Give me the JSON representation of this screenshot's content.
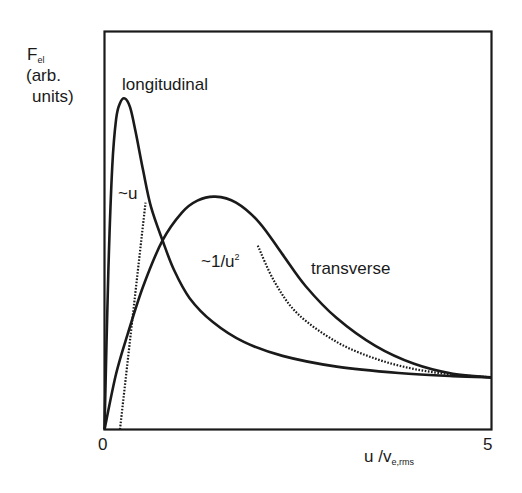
{
  "chart_data": {
    "type": "line",
    "title": "",
    "xlabel": "u / v_e,rms",
    "ylabel": "F_el (arb. units)",
    "xlim": [
      0,
      5
    ],
    "ylim": [
      0,
      100
    ],
    "xticks": [
      "0",
      "5"
    ],
    "grid": false,
    "legend": "none (curves labeled inline)",
    "series": [
      {
        "name": "longitudinal",
        "style": "solid",
        "x": [
          0,
          0.05,
          0.1,
          0.15,
          0.2,
          0.26,
          0.33,
          0.4,
          0.5,
          0.6,
          0.75,
          0.9,
          1.1,
          1.4,
          1.8,
          2.3,
          3.0,
          3.8,
          4.5,
          5.0
        ],
        "y": [
          0,
          40,
          66,
          78,
          82,
          83.2,
          81,
          75,
          65,
          56,
          47.5,
          40,
          33,
          27,
          22,
          18.5,
          15.8,
          14.2,
          13.4,
          13.1
        ]
      },
      {
        "name": "transverse",
        "style": "solid",
        "x": [
          0,
          0.15,
          0.3,
          0.5,
          0.75,
          1.0,
          1.2,
          1.43,
          1.7,
          2.0,
          2.3,
          2.6,
          3.0,
          3.5,
          4.0,
          4.5,
          5.0
        ],
        "y": [
          0,
          14,
          24,
          36,
          47.5,
          54.5,
          57.5,
          58.5,
          57,
          52,
          44,
          36,
          28,
          21,
          16.5,
          14,
          13.1
        ]
      },
      {
        "name": "~u",
        "style": "dotted",
        "x": [
          0.2,
          0.53
        ],
        "y": [
          0,
          57
        ]
      },
      {
        "name": "~1/u^2",
        "style": "dotted",
        "x": [
          1.98,
          2.2,
          2.5,
          3.0,
          3.5,
          4.0,
          4.5,
          5.0
        ],
        "y": [
          46.2,
          37,
          29,
          22,
          17.8,
          15.2,
          13.8,
          13.1
        ]
      }
    ],
    "annotations": [
      "longitudinal",
      "transverse",
      "~u",
      "~1/u²"
    ]
  },
  "labels": {
    "y_main": "F",
    "y_sub": "el",
    "y_line2": "(arb.",
    "y_line3": "units)",
    "x_main": "u /v",
    "x_sub": "e,rms",
    "tick_0": "0",
    "tick_5": "5",
    "longitudinal": "longitudinal",
    "transverse": "transverse",
    "approx_u": "~u",
    "approx_inv_main": "~1/u",
    "approx_inv_sup": "2"
  },
  "colors": {
    "line": "#1a1a1a",
    "background": "#ffffff"
  }
}
